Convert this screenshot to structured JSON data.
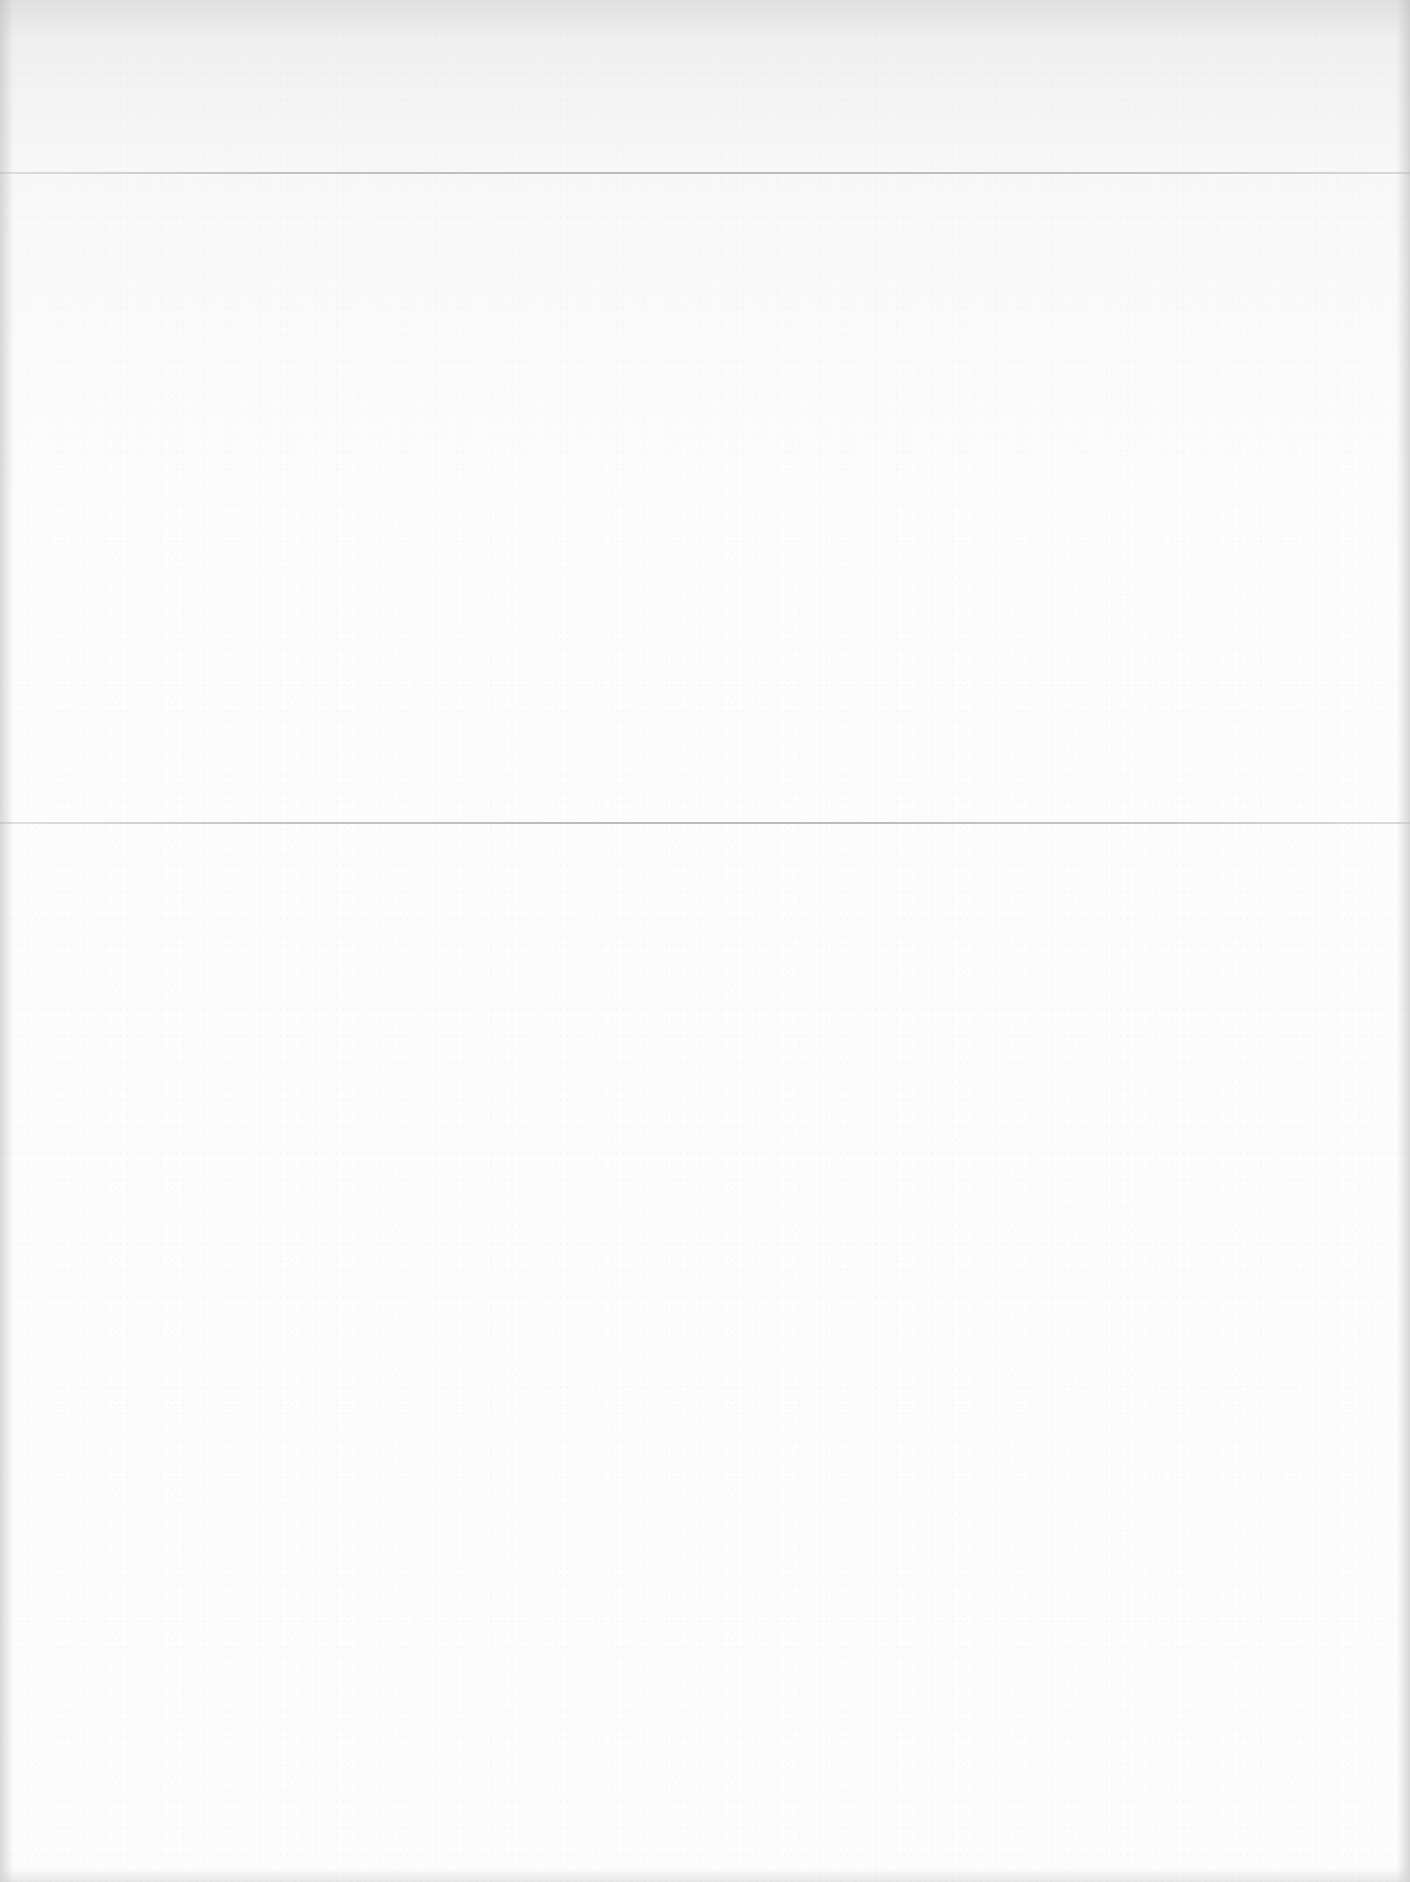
{
  "document": {
    "type": "scanned blank page",
    "text_content": [],
    "fold_lines": [
      {
        "name": "upper-fold",
        "y": 173
      },
      {
        "name": "lower-fold",
        "y": 823
      }
    ],
    "colors": {
      "paper": "#fdfdfd",
      "top_shading": "#d2d2d2",
      "fold_line": "#afafaf",
      "edge_shadow": "#bebebe"
    }
  }
}
